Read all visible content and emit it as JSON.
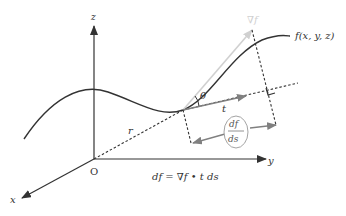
{
  "diagram": {
    "labels": {
      "z_axis": "z",
      "x_axis": "x",
      "y_axis": "y",
      "origin": "O",
      "position_vector": "r",
      "function": "f(x, y, z)",
      "gradient": "∇f",
      "angle": "θ",
      "tangent": "t",
      "deriv_num": "df",
      "deriv_den": "ds",
      "equation": "df = ∇f • t ds"
    },
    "colors": {
      "axis": "#333333",
      "curve": "#333333",
      "gradient_arrow": "#d0d0d0",
      "tangent_arrow": "#808080",
      "dashed": "#333333",
      "background": "#ffffff"
    }
  }
}
